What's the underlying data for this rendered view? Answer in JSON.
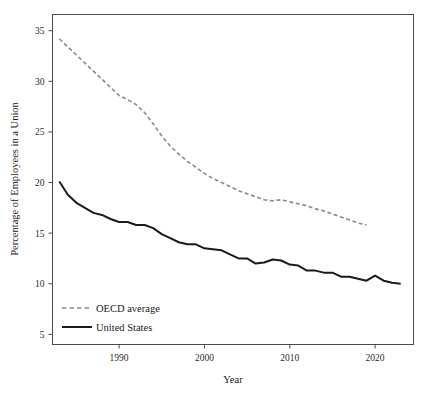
{
  "chart_data": {
    "type": "line",
    "title": "",
    "xlabel": "Year",
    "ylabel": "Percentage of Employees in a Union",
    "xlim": [
      1982.2,
      2024.5
    ],
    "ylim": [
      4.0,
      36.6
    ],
    "xticks": [
      1990,
      2000,
      2010,
      2020
    ],
    "xtick_labels": [
      "1990",
      "2000",
      "2010",
      "2020"
    ],
    "yticks": [
      5,
      10,
      15,
      20,
      25,
      30,
      35
    ],
    "ytick_labels": [
      "5",
      "10",
      "15",
      "20",
      "25",
      "30",
      "35"
    ],
    "grid": false,
    "legend_position": "bottom-left",
    "series": [
      {
        "name": "OECD average",
        "style": "dashed",
        "color": "#8a8a8a",
        "x": [
          1983,
          1984,
          1985,
          1986,
          1987,
          1988,
          1989,
          1990,
          1991,
          1992,
          1993,
          1994,
          1995,
          1996,
          1997,
          1998,
          1999,
          2000,
          2001,
          2002,
          2003,
          2004,
          2005,
          2006,
          2007,
          2008,
          2009,
          2010,
          2011,
          2012,
          2013,
          2014,
          2015,
          2016,
          2017,
          2018,
          2019
        ],
        "y": [
          34.2,
          33.4,
          32.6,
          31.8,
          31.0,
          30.2,
          29.4,
          28.6,
          28.2,
          27.7,
          26.9,
          25.8,
          24.6,
          23.6,
          22.8,
          22.1,
          21.5,
          20.9,
          20.4,
          20.0,
          19.6,
          19.2,
          18.9,
          18.6,
          18.3,
          18.2,
          18.3,
          18.1,
          17.9,
          17.7,
          17.4,
          17.2,
          16.9,
          16.6,
          16.3,
          16.0,
          15.8
        ]
      },
      {
        "name": "United States",
        "style": "solid",
        "color": "#1a1a1a",
        "x": [
          1983,
          1984,
          1985,
          1986,
          1987,
          1988,
          1989,
          1990,
          1991,
          1992,
          1993,
          1994,
          1995,
          1996,
          1997,
          1998,
          1999,
          2000,
          2001,
          2002,
          2003,
          2004,
          2005,
          2006,
          2007,
          2008,
          2009,
          2010,
          2011,
          2012,
          2013,
          2014,
          2015,
          2016,
          2017,
          2018,
          2019,
          2020,
          2021,
          2022,
          2023
        ],
        "y": [
          20.1,
          18.8,
          18.0,
          17.5,
          17.0,
          16.8,
          16.4,
          16.1,
          16.1,
          15.8,
          15.8,
          15.5,
          14.9,
          14.5,
          14.1,
          13.9,
          13.9,
          13.5,
          13.4,
          13.3,
          12.9,
          12.5,
          12.5,
          12.0,
          12.1,
          12.4,
          12.3,
          11.9,
          11.8,
          11.3,
          11.3,
          11.1,
          11.1,
          10.7,
          10.7,
          10.5,
          10.3,
          10.8,
          10.3,
          10.1,
          10.0
        ]
      }
    ]
  },
  "legend": {
    "entries": [
      {
        "label": "OECD average"
      },
      {
        "label": "United States"
      }
    ]
  }
}
